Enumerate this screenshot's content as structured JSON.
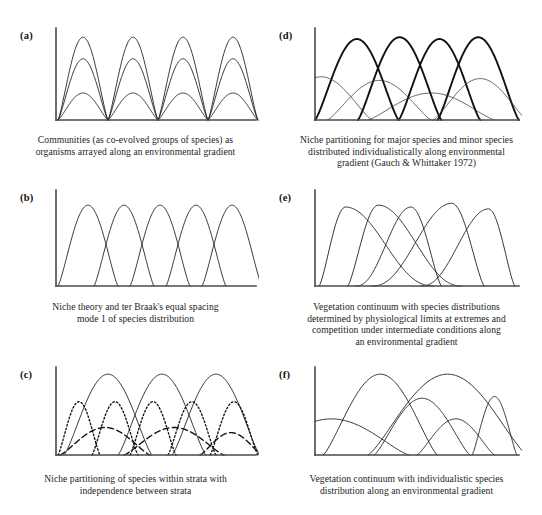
{
  "figure": {
    "title": "",
    "panel_count": 6,
    "layout": "2 columns x 3 rows"
  },
  "chart_data": {
    "type": "line",
    "xlabel": "Environmental gradient",
    "ylabel": "Species abundance",
    "grid": false,
    "legend": "none",
    "axis_ticks": "none",
    "xlim": [
      0,
      100
    ],
    "ylim": [
      0,
      100
    ],
    "panels": [
      {
        "id": "a",
        "label": "(a)",
        "caption_lines": [
          "Communities (as co-evolved groups of species) as",
          "organisms arrayed along an environmental gradient"
        ],
        "description": "Four community blocks; each block has three nested symmetric curves of differing heights sharing common zero points.",
        "series": [
          {
            "name": "block1-tall",
            "style": "solid",
            "peak_x": 13.5,
            "peak_y": 92,
            "start_x": 1,
            "end_x": 26
          },
          {
            "name": "block1-mid",
            "style": "solid",
            "peak_x": 13.5,
            "peak_y": 68,
            "start_x": 1,
            "end_x": 26
          },
          {
            "name": "block1-low",
            "style": "solid",
            "peak_x": 13.5,
            "peak_y": 30,
            "start_x": 1,
            "end_x": 26
          },
          {
            "name": "block2-tall",
            "style": "solid",
            "peak_x": 38.5,
            "peak_y": 92,
            "start_x": 26,
            "end_x": 51
          },
          {
            "name": "block2-mid",
            "style": "solid",
            "peak_x": 38.5,
            "peak_y": 68,
            "start_x": 26,
            "end_x": 51
          },
          {
            "name": "block2-low",
            "style": "solid",
            "peak_x": 38.5,
            "peak_y": 30,
            "start_x": 26,
            "end_x": 51
          },
          {
            "name": "block3-tall",
            "style": "solid",
            "peak_x": 63.5,
            "peak_y": 92,
            "start_x": 51,
            "end_x": 76
          },
          {
            "name": "block3-mid",
            "style": "solid",
            "peak_x": 63.5,
            "peak_y": 68,
            "start_x": 51,
            "end_x": 76
          },
          {
            "name": "block3-low",
            "style": "solid",
            "peak_x": 63.5,
            "peak_y": 30,
            "start_x": 51,
            "end_x": 76
          },
          {
            "name": "block4-tall",
            "style": "solid",
            "peak_x": 88.5,
            "peak_y": 92,
            "start_x": 76,
            "end_x": 101
          },
          {
            "name": "block4-mid",
            "style": "solid",
            "peak_x": 88.5,
            "peak_y": 68,
            "start_x": 76,
            "end_x": 101
          },
          {
            "name": "block4-low",
            "style": "solid",
            "peak_x": 88.5,
            "peak_y": 30,
            "start_x": 76,
            "end_x": 101
          }
        ]
      },
      {
        "id": "b",
        "label": "(b)",
        "caption_lines": [
          "Niche theory and ter Braak's equal spacing",
          "mode 1 of species distribution"
        ],
        "description": "Five identical symmetric bell curves of equal height and width, evenly spaced along the gradient.",
        "series": [
          {
            "name": "species-1",
            "style": "solid",
            "peak_x": 16,
            "peak_y": 86,
            "start_x": 1,
            "end_x": 31
          },
          {
            "name": "species-2",
            "style": "solid",
            "peak_x": 34,
            "peak_y": 86,
            "start_x": 19,
            "end_x": 49
          },
          {
            "name": "species-3",
            "style": "solid",
            "peak_x": 52,
            "peak_y": 86,
            "start_x": 37,
            "end_x": 67
          },
          {
            "name": "species-4",
            "style": "solid",
            "peak_x": 70,
            "peak_y": 86,
            "start_x": 55,
            "end_x": 85
          },
          {
            "name": "species-5",
            "style": "solid",
            "peak_x": 88,
            "peak_y": 86,
            "start_x": 73,
            "end_x": 103
          }
        ]
      },
      {
        "id": "c",
        "label": "(c)",
        "caption_lines": [
          "Niche partitioning of species within strata with",
          "independence between strata"
        ],
        "description": "Three strata shown with three line styles: tall solid curves, medium dotted curves, and low broad dashed curves; strata are mutually independent.",
        "series": [
          {
            "name": "stratum1-solid-1",
            "style": "solid",
            "peak_x": 26,
            "peak_y": 94,
            "start_x": 4,
            "end_x": 48
          },
          {
            "name": "stratum1-solid-2",
            "style": "solid",
            "peak_x": 53,
            "peak_y": 94,
            "start_x": 31,
            "end_x": 75
          },
          {
            "name": "stratum1-solid-3",
            "style": "solid",
            "peak_x": 80,
            "peak_y": 94,
            "start_x": 58,
            "end_x": 102
          },
          {
            "name": "stratum2-dotted-1",
            "style": "dotted",
            "peak_x": 10,
            "peak_y": 62,
            "start_x": 1,
            "end_x": 22
          },
          {
            "name": "stratum2-dotted-2",
            "style": "dotted",
            "peak_x": 29,
            "peak_y": 62,
            "start_x": 18,
            "end_x": 41
          },
          {
            "name": "stratum2-dotted-3",
            "style": "dotted",
            "peak_x": 48,
            "peak_y": 62,
            "start_x": 37,
            "end_x": 60
          },
          {
            "name": "stratum2-dotted-4",
            "style": "dotted",
            "peak_x": 68,
            "peak_y": 62,
            "start_x": 56,
            "end_x": 80
          },
          {
            "name": "stratum2-dotted-5",
            "style": "dotted",
            "peak_x": 89,
            "peak_y": 62,
            "start_x": 77,
            "end_x": 101
          },
          {
            "name": "stratum3-dashed-1",
            "style": "dashed",
            "peak_x": 22,
            "peak_y": 32,
            "start_x": 2,
            "end_x": 47
          },
          {
            "name": "stratum3-dashed-2",
            "style": "dashed",
            "peak_x": 58,
            "peak_y": 32,
            "start_x": 34,
            "end_x": 84
          },
          {
            "name": "stratum3-dashed-3",
            "style": "dashed",
            "peak_x": 93,
            "peak_y": 26,
            "start_x": 72,
            "end_x": 103
          }
        ]
      },
      {
        "id": "d",
        "label": "(d)",
        "caption_lines": [
          "Niche partitioning for major species and minor species",
          "distributed individualistically along environmental",
          "gradient (Gauch & Whittaker 1972)"
        ],
        "description": "Four tall heavy-line major species curves overlapping, plus several low thin-line minor species curves distributed individualistically.",
        "series": [
          {
            "name": "major-1",
            "style": "thick",
            "peak_x": 20,
            "peak_y": 90,
            "start_x": 0,
            "end_x": 41
          },
          {
            "name": "major-2",
            "style": "thick",
            "peak_x": 41,
            "peak_y": 92,
            "start_x": 21,
            "end_x": 62
          },
          {
            "name": "major-3",
            "style": "thick",
            "peak_x": 61,
            "peak_y": 90,
            "start_x": 41,
            "end_x": 81
          },
          {
            "name": "major-4",
            "style": "thick",
            "peak_x": 80,
            "peak_y": 92,
            "start_x": 60,
            "end_x": 100
          },
          {
            "name": "minor-1",
            "style": "thin",
            "peak_x": 3,
            "peak_y": 48,
            "start_x": -22,
            "end_x": 28
          },
          {
            "name": "minor-2",
            "style": "thin",
            "peak_x": 31,
            "peak_y": 44,
            "start_x": 6,
            "end_x": 57
          },
          {
            "name": "minor-3",
            "style": "thin",
            "peak_x": 56,
            "peak_y": 30,
            "start_x": 26,
            "end_x": 88
          },
          {
            "name": "minor-4",
            "style": "thin",
            "peak_x": 84,
            "peak_y": 46,
            "start_x": 58,
            "end_x": 104
          }
        ]
      },
      {
        "id": "e",
        "label": "(e)",
        "caption_lines": [
          "Vegetation continuum with species distributions",
          "determined by physiological limits at extremes and",
          "competition under intermediate conditions along",
          "an environmental gradient"
        ],
        "description": "Five skewed curves; each rises steeply or falls steeply at its physiological limit and tapers gradually where competition dominates, producing long crossing tails.",
        "series": [
          {
            "name": "species-1",
            "style": "skew",
            "peak_x": 15,
            "peak_y": 84,
            "start_x": 2,
            "end_x": 58,
            "skew": "right"
          },
          {
            "name": "species-2",
            "style": "skew",
            "peak_x": 31,
            "peak_y": 86,
            "start_x": 16,
            "end_x": 72,
            "skew": "right"
          },
          {
            "name": "species-3",
            "style": "skew",
            "peak_x": 47,
            "peak_y": 84,
            "start_x": 20,
            "end_x": 62,
            "skew": "left"
          },
          {
            "name": "species-4",
            "style": "skew",
            "peak_x": 67,
            "peak_y": 88,
            "start_x": 28,
            "end_x": 83,
            "skew": "left"
          },
          {
            "name": "species-5",
            "style": "skew",
            "peak_x": 85,
            "peak_y": 82,
            "start_x": 52,
            "end_x": 98,
            "skew": "left"
          }
        ]
      },
      {
        "id": "f",
        "label": "(f)",
        "caption_lines": [
          "Vegetation continuum with individualistic species",
          "distribution along an environmental gradient"
        ],
        "description": "Six curves of widely differing heights, widths and modal positions overlapping irregularly, showing individualistic species responses.",
        "series": [
          {
            "name": "species-1",
            "style": "solid",
            "peak_x": 2,
            "peak_y": 42,
            "start_x": -30,
            "end_x": 46
          },
          {
            "name": "species-2",
            "style": "solid",
            "peak_x": 30,
            "peak_y": 94,
            "start_x": 4,
            "end_x": 60
          },
          {
            "name": "species-3",
            "style": "solid",
            "peak_x": 58,
            "peak_y": 94,
            "start_x": 26,
            "end_x": 104
          },
          {
            "name": "species-4",
            "style": "solid",
            "peak_x": 52,
            "peak_y": 66,
            "start_x": 29,
            "end_x": 76
          },
          {
            "name": "species-5",
            "style": "solid",
            "peak_x": 71,
            "peak_y": 42,
            "start_x": 50,
            "end_x": 88
          },
          {
            "name": "species-6",
            "style": "solid",
            "peak_x": 88,
            "peak_y": 68,
            "start_x": 77,
            "end_x": 99
          }
        ]
      }
    ]
  }
}
